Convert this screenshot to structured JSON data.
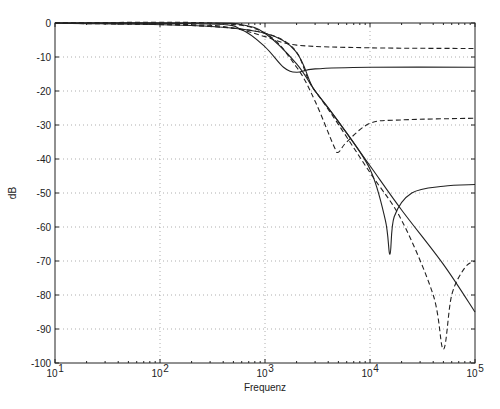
{
  "chart_data": {
    "type": "line",
    "title": "",
    "xlabel": "Frequenz",
    "ylabel": "dB",
    "xscale": "log",
    "xlim": [
      10,
      100000
    ],
    "ylim": [
      -100,
      0
    ],
    "grid": true,
    "x_ticks": [
      "10^1",
      "10^2",
      "10^3",
      "10^4",
      "10^5"
    ],
    "y_ticks": [
      0,
      -10,
      -20,
      -30,
      -40,
      -50,
      -60,
      -70,
      -80,
      -90,
      -100
    ],
    "series": [
      {
        "name": "solid-lowpass",
        "style": "solid",
        "points": [
          [
            10,
            0
          ],
          [
            300,
            0
          ],
          [
            600,
            -0.5
          ],
          [
            1000,
            -3
          ],
          [
            2000,
            -12
          ],
          [
            3000,
            -20
          ],
          [
            5000,
            -29
          ],
          [
            10000,
            -42
          ],
          [
            20000,
            -55
          ],
          [
            50000,
            -71
          ],
          [
            100000,
            -85
          ]
        ]
      },
      {
        "name": "solid-shelf",
        "style": "solid",
        "points": [
          [
            10,
            0
          ],
          [
            300,
            -0.3
          ],
          [
            600,
            -2
          ],
          [
            1000,
            -7
          ],
          [
            1500,
            -13
          ],
          [
            2000,
            -14.5
          ],
          [
            3000,
            -13.5
          ],
          [
            10000,
            -13
          ],
          [
            100000,
            -13
          ]
        ]
      },
      {
        "name": "dashed-shelf",
        "style": "dashed",
        "points": [
          [
            10,
            0
          ],
          [
            200,
            -0.5
          ],
          [
            500,
            -1.5
          ],
          [
            1000,
            -4
          ],
          [
            2000,
            -6.5
          ],
          [
            10000,
            -7.3
          ],
          [
            100000,
            -7.5
          ]
        ]
      },
      {
        "name": "dashed-notch-5k",
        "style": "dashed",
        "points": [
          [
            10,
            0
          ],
          [
            300,
            0
          ],
          [
            1000,
            -3
          ],
          [
            2000,
            -13
          ],
          [
            3000,
            -23
          ],
          [
            4500,
            -36
          ],
          [
            5000,
            -38
          ],
          [
            6000,
            -35
          ],
          [
            10000,
            -29.5
          ],
          [
            20000,
            -28.5
          ],
          [
            100000,
            -28
          ]
        ]
      },
      {
        "name": "solid-notch-15k",
        "style": "solid",
        "points": [
          [
            10,
            0
          ],
          [
            1000,
            -3
          ],
          [
            3000,
            -20
          ],
          [
            5000,
            -29
          ],
          [
            10000,
            -43
          ],
          [
            14000,
            -58
          ],
          [
            15500,
            -68
          ],
          [
            17000,
            -57
          ],
          [
            25000,
            -50
          ],
          [
            50000,
            -48
          ],
          [
            100000,
            -47.5
          ]
        ]
      },
      {
        "name": "dashed-notch-50k",
        "style": "dashed",
        "points": [
          [
            10,
            0
          ],
          [
            1000,
            -3
          ],
          [
            3000,
            -20
          ],
          [
            10000,
            -44
          ],
          [
            20000,
            -58
          ],
          [
            40000,
            -80
          ],
          [
            50000,
            -96
          ],
          [
            60000,
            -80
          ],
          [
            80000,
            -72
          ],
          [
            100000,
            -70
          ]
        ]
      }
    ]
  }
}
